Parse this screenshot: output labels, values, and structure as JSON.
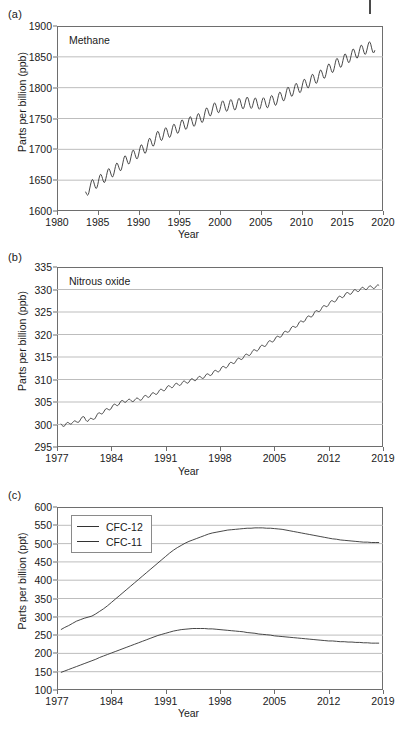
{
  "figure": {
    "panels": [
      {
        "label": "(a)",
        "annotation": "Methane",
        "ylabel": "Parts per billion (ppb)",
        "xlabel": "Year"
      },
      {
        "label": "(b)",
        "annotation": "Nitrous oxide",
        "ylabel": "Parts per billion (ppb)",
        "xlabel": "Year"
      },
      {
        "label": "(c)",
        "annotation": "",
        "ylabel": "Parts per billion (ppt)",
        "xlabel": "Year"
      }
    ]
  },
  "colors": {
    "line": "#333333",
    "grid": "#b5b5b5",
    "axis": "#6e6e6e",
    "text": "#1a1a1a",
    "background": "#ffffff"
  },
  "chart_data": [
    {
      "type": "line",
      "panel": "(a)",
      "title": "Methane",
      "xlabel": "Year",
      "ylabel": "Parts per billion (ppb)",
      "xlim": [
        1980,
        2020
      ],
      "ylim": [
        1600,
        1900
      ],
      "xticks": [
        1980,
        1985,
        1990,
        1995,
        2000,
        2005,
        2010,
        2015,
        2020
      ],
      "yticks": [
        1600,
        1650,
        1700,
        1750,
        1800,
        1850,
        1900
      ],
      "grid": true,
      "legend": false,
      "series": [
        {
          "name": "Methane",
          "units": "ppb",
          "seasonal_amplitude": 9,
          "x": [
            1983.5,
            1984,
            1984.5,
            1985,
            1985.5,
            1986,
            1986.5,
            1987,
            1987.5,
            1988,
            1988.5,
            1989,
            1989.5,
            1990,
            1990.5,
            1991,
            1991.5,
            1992,
            1992.5,
            1993,
            1993.5,
            1994,
            1994.5,
            1995,
            1995.5,
            1996,
            1996.5,
            1997,
            1997.5,
            1998,
            1998.5,
            1999,
            1999.5,
            2000,
            2000.5,
            2001,
            2001.5,
            2002,
            2002.5,
            2003,
            2003.5,
            2004,
            2004.5,
            2005,
            2005.5,
            2006,
            2006.5,
            2007,
            2007.5,
            2008,
            2008.5,
            2009,
            2009.5,
            2010,
            2010.5,
            2011,
            2011.5,
            2012,
            2012.5,
            2013,
            2013.5,
            2014,
            2014.5,
            2015,
            2015.5,
            2016,
            2016.5,
            2017,
            2017.5,
            2018,
            2018.5,
            2019
          ],
          "values": [
            1627,
            1640,
            1643,
            1647,
            1652,
            1657,
            1661,
            1666,
            1670,
            1677,
            1682,
            1687,
            1691,
            1695,
            1700,
            1704,
            1711,
            1716,
            1722,
            1724,
            1727,
            1729,
            1733,
            1736,
            1740,
            1742,
            1745,
            1747,
            1750,
            1754,
            1760,
            1765,
            1767,
            1769,
            1770,
            1771,
            1772,
            1773,
            1774,
            1775,
            1776,
            1775,
            1774,
            1774,
            1775,
            1777,
            1779,
            1781,
            1785,
            1789,
            1793,
            1796,
            1799,
            1802,
            1806,
            1810,
            1814,
            1817,
            1821,
            1826,
            1831,
            1835,
            1840,
            1843,
            1847,
            1851,
            1855,
            1858,
            1861,
            1864,
            1866,
            1865
          ]
        }
      ]
    },
    {
      "type": "line",
      "panel": "(b)",
      "title": "Nitrous oxide",
      "xlabel": "Year",
      "ylabel": "Parts per billion (ppb)",
      "xlim": [
        1977,
        2019
      ],
      "ylim": [
        295,
        335
      ],
      "xticks": [
        1977,
        1984,
        1991,
        1998,
        2005,
        2012,
        2019
      ],
      "yticks": [
        295,
        300,
        305,
        310,
        315,
        320,
        325,
        330,
        335
      ],
      "grid": true,
      "legend": false,
      "series": [
        {
          "name": "Nitrous oxide",
          "units": "ppb",
          "seasonal_amplitude": 0.35,
          "x": [
            1977.5,
            1978,
            1978.5,
            1979,
            1979.5,
            1980,
            1980.5,
            1981,
            1981.5,
            1982,
            1982.5,
            1983,
            1983.5,
            1984,
            1984.5,
            1985,
            1985.5,
            1986,
            1986.5,
            1987,
            1987.5,
            1988,
            1988.5,
            1989,
            1989.5,
            1990,
            1990.5,
            1991,
            1991.5,
            1992,
            1992.5,
            1993,
            1993.5,
            1994,
            1994.5,
            1995,
            1995.5,
            1996,
            1996.5,
            1997,
            1997.5,
            1998,
            1998.5,
            1999,
            1999.5,
            2000,
            2000.5,
            2001,
            2001.5,
            2002,
            2002.5,
            2003,
            2003.5,
            2004,
            2004.5,
            2005,
            2005.5,
            2006,
            2006.5,
            2007,
            2007.5,
            2008,
            2008.5,
            2009,
            2009.5,
            2010,
            2010.5,
            2011,
            2011.5,
            2012,
            2012.5,
            2013,
            2013.5,
            2014,
            2014.5,
            2015,
            2015.5,
            2016,
            2016.5,
            2017,
            2017.5,
            2018,
            2018.5
          ],
          "values": [
            300.0,
            299.9,
            300.2,
            300.6,
            300.4,
            301.2,
            301.5,
            300.9,
            301.1,
            301.8,
            302.4,
            302.9,
            303.3,
            303.8,
            304.3,
            304.7,
            305.1,
            305.4,
            305.2,
            305.6,
            305.5,
            305.9,
            306.2,
            306.5,
            306.8,
            307.2,
            307.6,
            308.0,
            308.4,
            308.6,
            308.9,
            309.1,
            309.4,
            309.6,
            309.9,
            310.2,
            310.4,
            310.7,
            311.0,
            311.4,
            311.8,
            312.2,
            312.7,
            313.1,
            313.6,
            314.1,
            314.5,
            315.0,
            315.4,
            315.9,
            316.4,
            316.9,
            317.4,
            317.9,
            318.4,
            318.9,
            319.4,
            320.0,
            320.5,
            321.1,
            321.6,
            322.2,
            322.8,
            323.4,
            323.9,
            324.5,
            325.1,
            325.7,
            326.2,
            326.8,
            327.3,
            327.8,
            328.3,
            328.7,
            329.1,
            329.4,
            329.7,
            330.0,
            330.2,
            330.4,
            330.5,
            330.6,
            330.7
          ]
        }
      ]
    },
    {
      "type": "line",
      "panel": "(c)",
      "title": "",
      "xlabel": "Year",
      "ylabel": "Parts per billion (ppt)",
      "xlim": [
        1977,
        2019
      ],
      "ylim": [
        100,
        600
      ],
      "xticks": [
        1977,
        1984,
        1991,
        1998,
        2005,
        2012,
        2019
      ],
      "yticks": [
        100,
        150,
        200,
        250,
        300,
        350,
        400,
        450,
        500,
        550,
        600
      ],
      "grid": true,
      "legend": true,
      "legend_position": "top-left",
      "series": [
        {
          "name": "CFC-12",
          "units": "ppt",
          "x": [
            1977.5,
            1978,
            1978.5,
            1979,
            1979.5,
            1980,
            1980.5,
            1981,
            1981.5,
            1982,
            1982.5,
            1983,
            1983.5,
            1984,
            1984.5,
            1985,
            1985.5,
            1986,
            1986.5,
            1987,
            1987.5,
            1988,
            1988.5,
            1989,
            1989.5,
            1990,
            1990.5,
            1991,
            1991.5,
            1992,
            1992.5,
            1993,
            1993.5,
            1994,
            1994.5,
            1995,
            1995.5,
            1996,
            1996.5,
            1997,
            1997.5,
            1998,
            1998.5,
            1999,
            1999.5,
            2000,
            2000.5,
            2001,
            2001.5,
            2002,
            2002.5,
            2003,
            2003.5,
            2004,
            2004.5,
            2005,
            2005.5,
            2006,
            2006.5,
            2007,
            2007.5,
            2008,
            2008.5,
            2009,
            2009.5,
            2010,
            2010.5,
            2011,
            2011.5,
            2012,
            2012.5,
            2013,
            2013.5,
            2014,
            2014.5,
            2015,
            2015.5,
            2016,
            2016.5,
            2017,
            2017.5,
            2018,
            2018.5
          ],
          "values": [
            265,
            271,
            276,
            282,
            288,
            292,
            296,
            299,
            302,
            308,
            315,
            322,
            330,
            339,
            348,
            357,
            366,
            375,
            384,
            393,
            402,
            411,
            420,
            429,
            438,
            447,
            456,
            465,
            474,
            482,
            489,
            495,
            501,
            506,
            510,
            514,
            518,
            522,
            526,
            529,
            531,
            533,
            535,
            537,
            538,
            539,
            540,
            541,
            542,
            542,
            543,
            543,
            543,
            542,
            542,
            541,
            540,
            539,
            537,
            535,
            533,
            531,
            529,
            527,
            525,
            523,
            521,
            519,
            517,
            515,
            513,
            512,
            510,
            509,
            508,
            507,
            506,
            505,
            504,
            504,
            503,
            503,
            503
          ]
        },
        {
          "name": "CFC-11",
          "units": "ppt",
          "x": [
            1977.5,
            1978,
            1978.5,
            1979,
            1979.5,
            1980,
            1980.5,
            1981,
            1981.5,
            1982,
            1982.5,
            1983,
            1983.5,
            1984,
            1984.5,
            1985,
            1985.5,
            1986,
            1986.5,
            1987,
            1987.5,
            1988,
            1988.5,
            1989,
            1989.5,
            1990,
            1990.5,
            1991,
            1991.5,
            1992,
            1992.5,
            1993,
            1993.5,
            1994,
            1994.5,
            1995,
            1995.5,
            1996,
            1996.5,
            1997,
            1997.5,
            1998,
            1998.5,
            1999,
            1999.5,
            2000,
            2000.5,
            2001,
            2001.5,
            2002,
            2002.5,
            2003,
            2003.5,
            2004,
            2004.5,
            2005,
            2005.5,
            2006,
            2006.5,
            2007,
            2007.5,
            2008,
            2008.5,
            2009,
            2009.5,
            2010,
            2010.5,
            2011,
            2011.5,
            2012,
            2012.5,
            2013,
            2013.5,
            2014,
            2014.5,
            2015,
            2015.5,
            2016,
            2016.5,
            2017,
            2017.5,
            2018,
            2018.5
          ],
          "values": [
            148,
            152,
            156,
            160,
            164,
            168,
            172,
            176,
            180,
            184,
            189,
            193,
            197,
            201,
            205,
            209,
            213,
            217,
            221,
            225,
            229,
            233,
            237,
            241,
            245,
            249,
            252,
            255,
            258,
            261,
            263,
            265,
            266,
            267,
            268,
            268,
            268,
            268,
            267,
            267,
            266,
            265,
            264,
            263,
            262,
            261,
            260,
            259,
            257,
            256,
            255,
            253,
            252,
            251,
            250,
            248,
            247,
            246,
            245,
            244,
            243,
            242,
            241,
            240,
            239,
            238,
            237,
            236,
            235,
            234,
            234,
            233,
            232,
            232,
            231,
            231,
            230,
            230,
            229,
            229,
            228,
            228,
            228
          ]
        }
      ]
    }
  ]
}
